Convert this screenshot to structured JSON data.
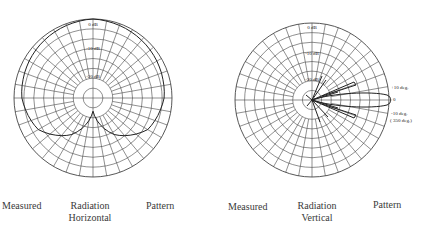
{
  "chart_data": [
    {
      "type": "polar",
      "title": "Measured Radiation Pattern - Horizontal",
      "caption": [
        "Measured",
        "Radiation",
        "Pattern"
      ],
      "subcaption": "Horizontal",
      "radial_labels": [
        "0 dB",
        "-10 dB",
        "-20 dB"
      ],
      "radial_range_db": [
        -30,
        0
      ],
      "grid": {
        "rings": 8,
        "spokes": 36
      },
      "pattern": {
        "description": "Broad near-omnidirectional pattern over upper hemisphere, deep null toward bottom",
        "angles_deg": [
          0,
          30,
          60,
          90,
          120,
          150,
          180,
          210,
          240,
          270,
          300,
          330
        ],
        "gain_db": [
          0,
          -1,
          -2,
          -3,
          -6,
          -14,
          -25,
          -14,
          -6,
          -3,
          -2,
          -1
        ]
      }
    },
    {
      "type": "polar",
      "title": "Measured Radiation Pattern - Vertical",
      "caption": [
        "Measured",
        "Radiation",
        "Pattern"
      ],
      "subcaption": "Vertical",
      "radial_labels": [
        "0 dB",
        "-10 dB",
        "-20 dB"
      ],
      "radial_range_db": [
        -30,
        0
      ],
      "grid": {
        "rings": 8,
        "spokes": 36
      },
      "angle_annotations": [
        "+10 deg.",
        "0",
        "-10 deg.",
        "( 350 deg.)"
      ],
      "pattern": {
        "description": "Narrow main lobe toward 0 deg with side lobes near +/-10 deg",
        "main_lobe_deg": 0,
        "main_lobe_gain_db": 0,
        "side_lobes": [
          {
            "angle_deg": 10,
            "gain_db": -9
          },
          {
            "angle_deg": -10,
            "gain_db": -9
          }
        ]
      }
    }
  ],
  "left": {
    "labels": {
      "r0": "0 dB",
      "r10": "-10 dB",
      "r20": "-20 dB"
    },
    "caption": {
      "a": "Measured",
      "b": "Radiation",
      "c": "Pattern",
      "sub": "Horizontal"
    }
  },
  "right": {
    "labels": {
      "r0": "0 dB",
      "r10": "-10 dB",
      "r20": "-20 dB",
      "plus10": "+10 deg.",
      "zero": "0",
      "minus10": "-10 deg.",
      "deg350": "( 350 deg.)"
    },
    "caption": {
      "a": "Measured",
      "b": "Radiation",
      "c": "Pattern",
      "sub": "Vertical"
    }
  }
}
